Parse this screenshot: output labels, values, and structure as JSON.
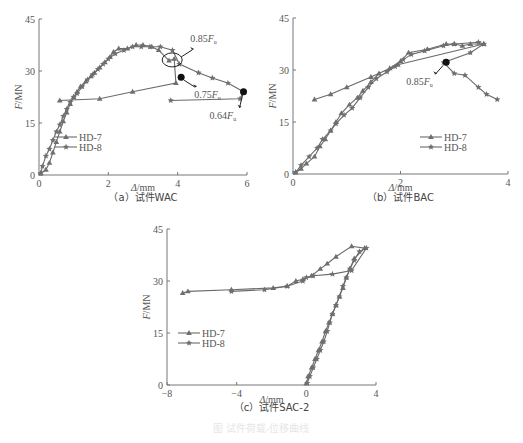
{
  "figure_caption": "图 试件荷载-位移曲线",
  "chart_data": [
    {
      "id": "a",
      "type": "line",
      "caption": "（a）试件WAC",
      "xlabel": "Δ/mm",
      "ylabel": "F/MN",
      "xlim": [
        0,
        6
      ],
      "ylim": [
        0,
        45
      ],
      "xticks": [
        0,
        2,
        4,
        6
      ],
      "yticks": [
        0,
        15,
        30,
        45
      ],
      "grid": false,
      "legend": {
        "position": "lower-center",
        "entries": [
          "HD-7",
          "HD-8"
        ]
      },
      "series": [
        {
          "name": "HD-7",
          "marker": "triangle",
          "x": [
            0.05,
            0.2,
            0.3,
            0.4,
            0.5,
            0.6,
            0.7,
            0.8,
            0.9,
            1.0,
            1.1,
            1.2,
            1.35,
            1.5,
            1.6,
            1.75,
            1.9,
            2.05,
            2.15,
            2.3,
            2.55,
            2.8,
            3.0,
            3.25,
            3.45,
            3.75,
            3.9,
            3.95,
            2.7,
            1.75,
            0.6
          ],
          "y": [
            0.5,
            1.5,
            3.5,
            6.5,
            9.5,
            12.5,
            15.5,
            18,
            20.5,
            22.5,
            24,
            25.5,
            27,
            28.5,
            29.5,
            31,
            32.5,
            34,
            35.5,
            36.5,
            36.5,
            37.5,
            37.5,
            37,
            36,
            33,
            33.5,
            26.5,
            24,
            22,
            21.5
          ]
        },
        {
          "name": "HD-8",
          "marker": "star",
          "x": [
            0.05,
            0.1,
            0.2,
            0.3,
            0.4,
            0.5,
            0.6,
            0.7,
            0.8,
            0.9,
            1.0,
            1.1,
            1.25,
            1.4,
            1.55,
            1.7,
            1.85,
            2.0,
            2.2,
            2.45,
            2.7,
            2.95,
            3.2,
            3.5,
            3.85,
            4.05,
            4.6,
            5.0,
            5.45,
            5.9,
            5.8,
            3.8
          ],
          "y": [
            0.5,
            2.5,
            5.5,
            7.5,
            10,
            12.5,
            14.5,
            17,
            19,
            21,
            22.5,
            23.5,
            25.5,
            27.5,
            29,
            30.5,
            32,
            33.5,
            35,
            36,
            37,
            37,
            37,
            37,
            36,
            32,
            29.5,
            28,
            26.5,
            24,
            22,
            21.5
          ]
        }
      ],
      "annotations": [
        {
          "text": "0.85F",
          "sub": "u",
          "point": [
            3.9,
            33.2
          ]
        },
        {
          "text": "0.75F",
          "sub": "u",
          "point": [
            4.1,
            28.2
          ]
        },
        {
          "text": "0.64F",
          "sub": "u",
          "point": [
            5.9,
            24
          ]
        }
      ]
    },
    {
      "id": "b",
      "type": "line",
      "caption": "（b）试件BAC",
      "xlabel": "Δ/mm",
      "ylabel": "F/MN",
      "xlim": [
        0,
        4
      ],
      "ylim": [
        0,
        45
      ],
      "xticks": [
        0,
        2,
        4
      ],
      "yticks": [
        0,
        15,
        30,
        45
      ],
      "grid": false,
      "legend": {
        "position": "lower-right",
        "entries": [
          "HD-7",
          "HD-8"
        ]
      },
      "series": [
        {
          "name": "HD-7",
          "marker": "triangle",
          "x": [
            0.05,
            0.15,
            0.25,
            0.4,
            0.5,
            0.6,
            0.7,
            0.8,
            0.9,
            1.05,
            1.2,
            1.3,
            1.45,
            1.6,
            1.8,
            2.0,
            2.15,
            2.5,
            2.85,
            3.0,
            3.15,
            3.3,
            3.55,
            1.95,
            1.45,
            1.0,
            0.7,
            0.4
          ],
          "y": [
            0.5,
            1.5,
            3,
            5,
            8,
            10,
            12.5,
            15,
            17.5,
            20,
            22,
            24,
            26.5,
            29,
            30.5,
            32.5,
            35,
            36,
            37.5,
            37.5,
            37,
            37.5,
            37.5,
            31.5,
            28,
            25,
            23,
            21.5
          ],
          "note": "loop returns to (0.6,21.5)"
        },
        {
          "name": "HD-8",
          "marker": "star",
          "x": [
            0.05,
            0.15,
            0.3,
            0.45,
            0.55,
            0.7,
            0.8,
            0.95,
            1.1,
            1.25,
            1.4,
            1.55,
            1.75,
            1.9,
            2.05,
            2.2,
            2.45,
            2.8,
            3.0,
            3.45,
            3.55,
            3.3,
            2.8,
            3.0,
            3.2,
            3.45,
            3.6,
            3.8
          ],
          "y": [
            0.5,
            2.5,
            5,
            7.5,
            10,
            12.5,
            14.5,
            17,
            19,
            22,
            25,
            27.5,
            29.5,
            31,
            33,
            34.5,
            35.5,
            37,
            37.5,
            38,
            37.5,
            35,
            32.2,
            29,
            28.5,
            25,
            23,
            21.5
          ]
        }
      ],
      "annotations": [
        {
          "text": "0.85F",
          "sub": "u",
          "point": [
            2.85,
            32.2
          ]
        }
      ]
    },
    {
      "id": "c",
      "type": "line",
      "caption": "（c）试件SAC-2",
      "xlabel": "Δ/mm",
      "ylabel": "F/MN",
      "xlim": [
        -8,
        4
      ],
      "ylim": [
        0,
        45
      ],
      "xticks": [
        -8,
        -4,
        0,
        4
      ],
      "yticks": [
        0,
        15,
        30,
        45
      ],
      "grid": false,
      "legend": {
        "position": "center-left",
        "entries": [
          "HD-7",
          "HD-8"
        ]
      },
      "series": [
        {
          "name": "HD-7",
          "marker": "triangle",
          "x": [
            0.0,
            0.1,
            0.3,
            0.5,
            0.7,
            0.9,
            1.1,
            1.3,
            1.5,
            1.7,
            1.9,
            2.1,
            2.3,
            2.5,
            2.75,
            3.35,
            2.6,
            1.7,
            1.2,
            0.8,
            0.3,
            -0.2,
            -0.6,
            -1.1,
            -1.9,
            -4.3,
            -6.8,
            -7.1
          ],
          "y": [
            0.5,
            2.5,
            5,
            7.5,
            10,
            12.5,
            15.5,
            18,
            20.5,
            23,
            25.5,
            28,
            31,
            33.5,
            36.5,
            39.5,
            40,
            37,
            35,
            33.5,
            31.5,
            30.5,
            30,
            28.5,
            28,
            27.5,
            27,
            26.5
          ]
        },
        {
          "name": "HD-8",
          "marker": "star",
          "x": [
            0.05,
            0.2,
            0.4,
            0.6,
            0.8,
            1.0,
            1.2,
            1.35,
            1.5,
            1.7,
            1.9,
            2.1,
            2.3,
            2.5,
            2.75,
            3.05,
            3.45,
            2.6,
            1.5,
            0.4,
            0.0,
            -0.2,
            -1.1,
            -2.4,
            -4.3
          ],
          "y": [
            0.5,
            2.5,
            5,
            7.5,
            10,
            12.5,
            15.5,
            18,
            20.5,
            23,
            25.5,
            28.5,
            31,
            33.5,
            36,
            38.5,
            39.5,
            33,
            32,
            31.5,
            31,
            30,
            28.5,
            27.5,
            27
          ]
        }
      ]
    }
  ],
  "colors": {
    "line": "#6a6a6a",
    "marker": "#6f6f6f",
    "axis": "#777777",
    "highlight": "#111111"
  }
}
